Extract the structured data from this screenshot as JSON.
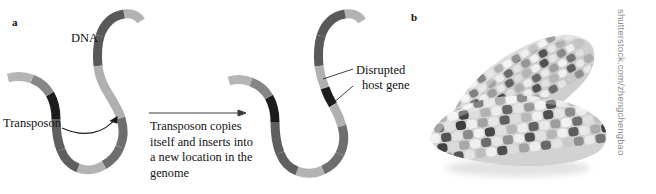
{
  "figure": {
    "background_color": "#ffffff",
    "width": 656,
    "height": 194
  },
  "panel_a": {
    "letter": "a",
    "labels": {
      "dna": "DNA",
      "transposon": "Transposon",
      "disrupted_gene_line1": "Disrupted",
      "disrupted_gene_line2": "host gene"
    },
    "process_caption": "Transposon copies itself and inserts into a new location in the genome",
    "colors": {
      "dna_light": "#b3b3b3",
      "dna_mid": "#8c8c8c",
      "dna_dark": "#5c5c5c",
      "transposon_black": "#1c1c1c",
      "leader_line": "#2b2b2b"
    },
    "left_strand_segments": [
      {
        "name": "light-tip-top",
        "tone": "#b3b3b3"
      },
      {
        "name": "dark-upper",
        "tone": "#595959"
      },
      {
        "name": "light-upper-mid",
        "tone": "#b0b0b0"
      },
      {
        "name": "dark-mid",
        "tone": "#6e6e6e"
      },
      {
        "name": "light-bottom-curve",
        "tone": "#b3b3b3"
      },
      {
        "name": "dark-lower-left",
        "tone": "#5f5f5f"
      },
      {
        "name": "transposon-black",
        "tone": "#1c1c1c"
      },
      {
        "name": "mid-gray-left",
        "tone": "#868686"
      },
      {
        "name": "light-tip-left",
        "tone": "#b5b5b5"
      }
    ],
    "right_strand_segments": [
      {
        "name": "light-tip-top",
        "tone": "#b3b3b3"
      },
      {
        "name": "dark-upper",
        "tone": "#595959"
      },
      {
        "name": "light-host-gene",
        "tone": "#b0b0b0"
      },
      {
        "name": "inserted-transposon-black",
        "tone": "#1c1c1c"
      },
      {
        "name": "light-host-gene-lower",
        "tone": "#b0b0b0"
      },
      {
        "name": "dark-mid",
        "tone": "#6e6e6e"
      },
      {
        "name": "light-bottom-curve",
        "tone": "#b3b3b3"
      },
      {
        "name": "dark-lower-left",
        "tone": "#5f5f5f"
      },
      {
        "name": "transposon-black",
        "tone": "#1c1c1c"
      },
      {
        "name": "mid-gray-left",
        "tone": "#868686"
      },
      {
        "name": "light-tip-left",
        "tone": "#b5b5b5"
      }
    ]
  },
  "panel_b": {
    "letter": "b",
    "subject": "two variegated maize cobs with mottled kernels",
    "credit": "shutterstock.com/zhengchengbao",
    "credit_color": "#8a8a8a"
  }
}
